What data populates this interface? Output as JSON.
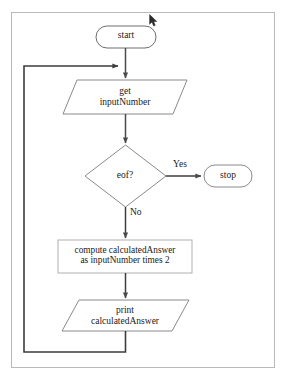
{
  "diagram": {
    "frame": {
      "border_color": "#b9b9b9"
    },
    "stroke_color": "#6e6e6e",
    "arrow_color": "#4a4a4a",
    "loop_color": "#5a5a5a",
    "text_color": "#1a1a1a",
    "nodes": [
      {
        "id": "start",
        "shape": "terminal",
        "label": "start"
      },
      {
        "id": "input",
        "shape": "parallelogram",
        "label": "get\ninputNumber"
      },
      {
        "id": "decision",
        "shape": "diamond",
        "label": "eof?"
      },
      {
        "id": "stop",
        "shape": "terminal",
        "label": "stop"
      },
      {
        "id": "compute",
        "shape": "process",
        "label": "compute calculatedAnswer\nas inputNumber times 2"
      },
      {
        "id": "print",
        "shape": "parallelogram",
        "label": "print\ncalculatedAnswer"
      }
    ],
    "edges": [
      {
        "from": "start",
        "to": "input",
        "label": ""
      },
      {
        "from": "input",
        "to": "decision",
        "label": ""
      },
      {
        "from": "decision",
        "to": "stop",
        "label": "Yes"
      },
      {
        "from": "decision",
        "to": "compute",
        "label": "No"
      },
      {
        "from": "compute",
        "to": "print",
        "label": ""
      },
      {
        "from": "print",
        "to": "input",
        "label": ""
      }
    ]
  },
  "cursor": {
    "name": "mouse-pointer",
    "x": 149,
    "y": 14
  }
}
